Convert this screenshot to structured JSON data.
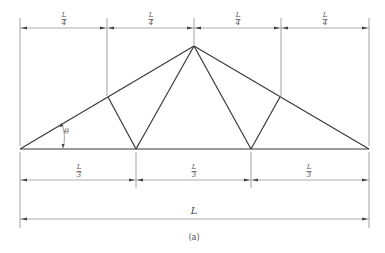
{
  "figure": {
    "caption": "(a)",
    "angle_label": "θ",
    "top_dimensions": [
      {
        "num": "L",
        "den": "4"
      },
      {
        "num": "L",
        "den": "4"
      },
      {
        "num": "L",
        "den": "4"
      },
      {
        "num": "L",
        "den": "4"
      }
    ],
    "bottom_dimensions": [
      {
        "num": "L",
        "den": "3"
      },
      {
        "num": "L",
        "den": "3"
      },
      {
        "num": "L",
        "den": "3"
      }
    ],
    "overall_dimension": "L",
    "colors": {
      "members": "#3a3a3a",
      "dimension_lines": "#9a9a9a"
    }
  }
}
